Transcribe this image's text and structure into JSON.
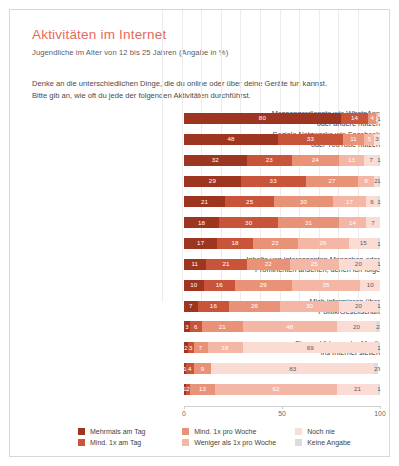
{
  "header": {
    "title": "Aktivitäten im Internet",
    "subtitle": "Jugendliche im Alter von 12 bis 25 Jahren (Angabe in %)",
    "question_line1": "Denke an die unterschiedlichen Dinge, die du online oder über deine Geräte tun kannst.",
    "question_line2": "Bitte gib an, wie oft du jede der folgenden Aktivitäten durchführst."
  },
  "chart_data": {
    "type": "bar",
    "orientation": "horizontal",
    "stacked": true,
    "unit": "%",
    "title": "Aktivitäten im Internet",
    "subtitle": "Jugendliche im Alter von 12 bis 25 Jahren (Angabe in %)",
    "xlabel": "",
    "ylabel": "",
    "xlim": [
      0,
      100
    ],
    "xticks": [
      0,
      50,
      100
    ],
    "xticklabels": [
      "0",
      "50",
      "100"
    ],
    "grid": true,
    "legend_position": "bottom",
    "categories": [
      "Messengerdienste wie WhatsApp oder andere nutzen",
      "Soziale Netzwerke wie Facebook oder YouTube nutzen",
      "Musik runterladen oder hören",
      "Informationssuche",
      "Nutzung für Schule, Ausbildung, Beruf",
      "Videos, Filme, Serien online anschauen",
      "Spiele, Gamen",
      "Inhalte von interessanten Menschen oder Prominenten ansehen, denen ich folge",
      "E-Mails versenden",
      "Mich informieren über Politik/Gesellschaft",
      "Eigene Photos posten",
      "Eigene Videos oder Musik ins Internet stellen",
      "Meinen Blog schreiben",
      "Online einkaufen"
    ],
    "series": [
      {
        "name": "Mehrmals am Tag",
        "color": "#9e3520",
        "values": [
          80,
          48,
          32,
          29,
          21,
          18,
          17,
          11,
          10,
          7,
          3,
          2,
          1,
          1
        ]
      },
      {
        "name": "Mind. 1x am Tag",
        "color": "#c8553a",
        "values": [
          14,
          33,
          23,
          33,
          25,
          30,
          18,
          21,
          16,
          16,
          6,
          3,
          4,
          2
        ]
      },
      {
        "name": "Mind. 1x pro Woche",
        "color": "#e89277",
        "values": [
          4,
          11,
          24,
          27,
          30,
          31,
          23,
          22,
          29,
          26,
          21,
          7,
          9,
          13
        ]
      },
      {
        "name": "Weniger als 1x pro Woche",
        "color": "#f4b6a5",
        "values": [
          1,
          5,
          13,
          8,
          17,
          14,
          26,
          25,
          35,
          30,
          48,
          18,
          0,
          62
        ]
      },
      {
        "name": "Noch nie",
        "color": "#fbdcd4",
        "values": [
          1,
          3,
          7,
          2,
          6,
          7,
          15,
          20,
          10,
          20,
          20,
          69,
          83,
          21
        ]
      },
      {
        "name": "Keine Angabe",
        "color": "#dcdcdc",
        "values": [
          0,
          0,
          1,
          1,
          1,
          0,
          1,
          1,
          0,
          1,
          2,
          1,
          2,
          1
        ]
      }
    ],
    "rows": [
      {
        "label": "Messengerdienste wie WhatsApp oder andere nutzen",
        "label_lines": [
          "Messengerdienste wie WhatsApp",
          "oder andere nutzen"
        ],
        "values": [
          80,
          14,
          4,
          1,
          1,
          0
        ],
        "labels": [
          "80",
          "14",
          "4",
          "1",
          "1",
          ""
        ]
      },
      {
        "label": "Soziale Netzwerke wie Facebook oder YouTube nutzen",
        "label_lines": [
          "Soziale Netzwerke wie Facebook",
          "oder YouTube nutzen"
        ],
        "values": [
          48,
          33,
          11,
          5,
          3,
          0
        ],
        "labels": [
          "48",
          "33",
          "11",
          "5",
          "3",
          ""
        ]
      },
      {
        "label": "Musik runterladen oder hören",
        "label_lines": [
          "Musik runterladen oder hören"
        ],
        "values": [
          32,
          23,
          24,
          13,
          7,
          1
        ],
        "labels": [
          "32",
          "23",
          "24",
          "13",
          "7",
          "1"
        ]
      },
      {
        "label": "Informationssuche",
        "label_lines": [
          "Informationssuche"
        ],
        "values": [
          29,
          33,
          27,
          8,
          2,
          1
        ],
        "labels": [
          "29",
          "33",
          "27",
          "8",
          "2",
          "1"
        ]
      },
      {
        "label": "Nutzung für Schule, Ausbildung, Beruf",
        "label_lines": [
          "Nutzung für Schule, Ausbildung, Beruf"
        ],
        "values": [
          21,
          25,
          30,
          17,
          6,
          1
        ],
        "labels": [
          "21",
          "25",
          "30",
          "17",
          "6",
          "1"
        ]
      },
      {
        "label": "Videos, Filme, Serien online anschauen",
        "label_lines": [
          "Videos, Filme, Serien online anschauen"
        ],
        "values": [
          18,
          30,
          31,
          14,
          7,
          0
        ],
        "labels": [
          "18",
          "30",
          "31",
          "14",
          "7",
          ""
        ]
      },
      {
        "label": "Spiele, Gamen",
        "label_lines": [
          "Spiele, Gamen"
        ],
        "values": [
          17,
          18,
          23,
          26,
          15,
          1
        ],
        "labels": [
          "17",
          "18",
          "23",
          "26",
          "15",
          "1"
        ]
      },
      {
        "label": "Inhalte von interessanten Menschen oder Prominenten ansehen, denen ich folge",
        "label_lines": [
          "Inhalte von interessanten Menschen oder",
          "Prominenten ansehen, denen ich folge"
        ],
        "values": [
          11,
          21,
          22,
          25,
          20,
          1
        ],
        "labels": [
          "11",
          "21",
          "22",
          "25",
          "20",
          "1"
        ]
      },
      {
        "label": "E-Mails versenden",
        "label_lines": [
          "E-Mails versenden"
        ],
        "values": [
          10,
          16,
          29,
          35,
          10,
          0
        ],
        "labels": [
          "10",
          "16",
          "29",
          "35",
          "10",
          ""
        ]
      },
      {
        "label": "Mich informieren über Politik/Gesellschaft",
        "label_lines": [
          "Mich informieren über",
          "Politik/Gesellschaft"
        ],
        "values": [
          7,
          16,
          26,
          30,
          20,
          1
        ],
        "labels": [
          "7",
          "16",
          "26",
          "30",
          "20",
          "1"
        ]
      },
      {
        "label": "Eigene Photos posten",
        "label_lines": [
          "Eigene Photos posten"
        ],
        "values": [
          3,
          6,
          21,
          48,
          20,
          2
        ],
        "labels": [
          "3",
          "6",
          "21",
          "48",
          "20",
          "2"
        ]
      },
      {
        "label": "Eigene Videos oder Musik ins Internet stellen",
        "label_lines": [
          "Eigene Videos oder Musik",
          "ins Internet stellen"
        ],
        "values": [
          2,
          3,
          7,
          18,
          69,
          1
        ],
        "labels": [
          "2",
          "3",
          "7",
          "18",
          "69",
          "1"
        ]
      },
      {
        "label": "Meinen Blog schreiben",
        "label_lines": [
          "Meinen Blog schreiben"
        ],
        "values": [
          1,
          4,
          9,
          0,
          83,
          2
        ],
        "labels": [
          "1",
          "4",
          "9",
          "",
          "83",
          "2"
        ]
      },
      {
        "label": "Online einkaufen",
        "label_lines": [
          "Online einkaufen"
        ],
        "values": [
          1,
          2,
          13,
          62,
          21,
          1
        ],
        "labels": [
          "1",
          "2",
          "13",
          "62",
          "21",
          "1"
        ]
      }
    ],
    "legend": [
      {
        "label": "Mehrmals am Tag",
        "color": "#9e3520"
      },
      {
        "label": "Mind. 1x am Tag",
        "color": "#c8553a"
      },
      {
        "label": "Mind. 1x pro Woche",
        "color": "#e89277"
      },
      {
        "label": "Weniger als 1x pro Woche",
        "color": "#f4b6a5"
      },
      {
        "label": "Noch nie",
        "color": "#fbdcd4"
      },
      {
        "label": "Keine Angabe",
        "color": "#dcdcdc"
      }
    ]
  }
}
